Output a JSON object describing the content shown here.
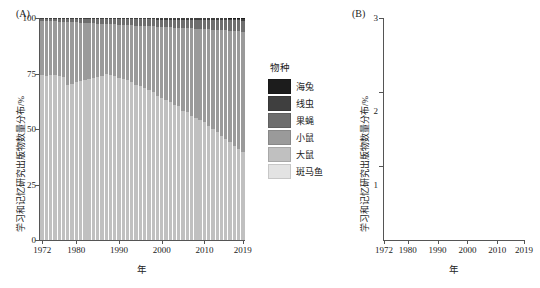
{
  "figure": {
    "panel_a_label": "(A)",
    "panel_b_label": "(B)"
  },
  "legend": {
    "title": "物种",
    "items": [
      {
        "label": "海兔",
        "color": "#1c1c1c"
      },
      {
        "label": "线虫",
        "color": "#3f3f3f"
      },
      {
        "label": "果蝇",
        "color": "#6e6e6e"
      },
      {
        "label": "小鼠",
        "color": "#9a9a9a"
      },
      {
        "label": "大鼠",
        "color": "#c0c0c0"
      },
      {
        "label": "斑马鱼",
        "color": "#e3e3e3"
      }
    ]
  },
  "panel_a": {
    "axis_title_y": "学习和记忆研究出版物数量分布/%",
    "axis_title_x": "年",
    "y_ticks": [
      "0",
      "25",
      "50",
      "75",
      "100"
    ],
    "x_ticks": [
      "1972",
      "1980",
      "1990",
      "2000",
      "2010",
      "2019"
    ]
  },
  "panel_b": {
    "axis_title_y": "学习和记忆研究出版物数量分布/%",
    "axis_title_x": "年",
    "y_ticks": [
      "1",
      "2",
      "3"
    ],
    "x_ticks": [
      "1972",
      "1980",
      "1990",
      "2000",
      "2010",
      "2019"
    ]
  },
  "chart_data": [
    {
      "type": "bar",
      "id": "panel-A",
      "title": "",
      "subtitle": "Stacked 100% composition of model species in learning & memory publications",
      "stacked": true,
      "stack_mode": "percent",
      "xlabel": "年",
      "ylabel": "学习和记忆研究出版物数量分布/%",
      "ylim": [
        0,
        100
      ],
      "grid": false,
      "legend_position": "right",
      "categories": [
        1972,
        1973,
        1974,
        1975,
        1976,
        1977,
        1978,
        1979,
        1980,
        1981,
        1982,
        1983,
        1984,
        1985,
        1986,
        1987,
        1988,
        1989,
        1990,
        1991,
        1992,
        1993,
        1994,
        1995,
        1996,
        1997,
        1998,
        1999,
        2000,
        2001,
        2002,
        2003,
        2004,
        2005,
        2006,
        2007,
        2008,
        2009,
        2010,
        2011,
        2012,
        2013,
        2014,
        2015,
        2016,
        2017,
        2018,
        2019
      ],
      "series": [
        {
          "name": "大鼠",
          "color": "#c0c0c0",
          "values": [
            74.5,
            74.0,
            74.2,
            74.5,
            74.0,
            73.5,
            70.0,
            70.5,
            71.0,
            71.5,
            72.0,
            72.5,
            73.0,
            73.5,
            74.0,
            75.0,
            74.5,
            74.0,
            73.0,
            72.5,
            72.0,
            71.0,
            70.0,
            69.5,
            68.5,
            67.5,
            66.5,
            65.0,
            64.0,
            63.0,
            62.0,
            61.0,
            60.5,
            58.0,
            57.5,
            56.0,
            55.0,
            54.0,
            53.0,
            51.5,
            50.0,
            48.5,
            47.0,
            45.5,
            44.0,
            42.5,
            41.0,
            39.5
          ]
        },
        {
          "name": "小鼠",
          "color": "#9a9a9a",
          "values": [
            24.0,
            24.5,
            24.3,
            24.0,
            24.4,
            24.8,
            28.2,
            27.6,
            27.0,
            26.4,
            25.8,
            25.2,
            24.6,
            24.0,
            23.4,
            22.3,
            22.7,
            23.1,
            24.0,
            24.4,
            24.8,
            25.7,
            26.6,
            27.0,
            27.9,
            28.8,
            29.7,
            31.1,
            32.0,
            32.9,
            33.8,
            34.7,
            35.1,
            37.5,
            37.9,
            39.3,
            40.2,
            41.1,
            42.0,
            43.4,
            44.8,
            46.2,
            47.6,
            49.0,
            50.3,
            51.7,
            53.1,
            54.4
          ]
        },
        {
          "name": "果蝇",
          "color": "#6e6e6e",
          "values": [
            1.1,
            1.1,
            1.2,
            1.1,
            1.2,
            1.3,
            1.4,
            1.5,
            1.6,
            1.7,
            1.8,
            1.9,
            2.0,
            2.1,
            2.2,
            2.3,
            2.4,
            2.4,
            2.5,
            2.6,
            2.7,
            2.8,
            2.9,
            2.9,
            3.0,
            3.1,
            3.2,
            3.2,
            3.3,
            3.4,
            3.5,
            3.6,
            3.6,
            3.7,
            3.8,
            3.9,
            3.9,
            4.0,
            4.1,
            4.2,
            4.3,
            4.4,
            4.4,
            4.5,
            4.6,
            4.7,
            4.8,
            4.9
          ]
        },
        {
          "name": "线虫",
          "color": "#3f3f3f",
          "values": [
            0.2,
            0.2,
            0.2,
            0.2,
            0.2,
            0.2,
            0.2,
            0.2,
            0.2,
            0.2,
            0.2,
            0.2,
            0.2,
            0.2,
            0.2,
            0.2,
            0.2,
            0.3,
            0.3,
            0.3,
            0.3,
            0.3,
            0.3,
            0.4,
            0.4,
            0.4,
            0.4,
            0.5,
            0.5,
            0.5,
            0.5,
            0.5,
            0.6,
            0.6,
            0.6,
            0.6,
            0.7,
            0.7,
            0.7,
            0.7,
            0.7,
            0.7,
            0.8,
            0.8,
            0.8,
            0.8,
            0.8,
            0.9
          ]
        },
        {
          "name": "海兔",
          "color": "#1c1c1c",
          "values": [
            0.2,
            0.2,
            0.1,
            0.2,
            0.2,
            0.2,
            0.2,
            0.2,
            0.2,
            0.2,
            0.2,
            0.2,
            0.2,
            0.2,
            0.2,
            0.2,
            0.2,
            0.2,
            0.2,
            0.2,
            0.2,
            0.2,
            0.2,
            0.2,
            0.2,
            0.2,
            0.2,
            0.2,
            0.2,
            0.2,
            0.2,
            0.2,
            0.2,
            0.2,
            0.2,
            0.2,
            0.2,
            0.2,
            0.2,
            0.2,
            0.2,
            0.2,
            0.2,
            0.2,
            0.3,
            0.3,
            0.3,
            0.3
          ]
        },
        {
          "name": "斑马鱼",
          "color": "#e3e3e3",
          "values": [
            0.0,
            0.0,
            0.0,
            0.0,
            0.0,
            0.0,
            0.0,
            0.0,
            0.0,
            0.0,
            0.0,
            0.0,
            0.0,
            0.0,
            0.0,
            0.0,
            0.0,
            0.0,
            0.0,
            0.0,
            0.0,
            0.0,
            0.0,
            0.0,
            0.0,
            0.0,
            0.0,
            0.0,
            0.0,
            0.0,
            0.0,
            0.0,
            0.0,
            0.0,
            0.0,
            0.0,
            0.0,
            0.0,
            0.0,
            0.0,
            0.0,
            0.0,
            0.0,
            0.0,
            0.0,
            0.0,
            0.0,
            0.0
          ]
        }
      ]
    },
    {
      "type": "line",
      "id": "panel-B",
      "title": "",
      "subtitle": "Non-rodent model species share of learning & memory publications",
      "xlabel": "年",
      "ylabel": "学习和记忆研究出版物数量分布/%",
      "xlim": [
        1972,
        2019
      ],
      "ylim": [
        0,
        3
      ],
      "grid": false,
      "legend_position": "none",
      "x": [
        1972,
        1973,
        1974,
        1975,
        1976,
        1977,
        1978,
        1979,
        1980,
        1981,
        1982,
        1983,
        1984,
        1985,
        1986,
        1987,
        1988,
        1989,
        1990,
        1991,
        1992,
        1993,
        1994,
        1995,
        1996,
        1997,
        1998,
        1999,
        2000,
        2001,
        2002,
        2003,
        2004,
        2005,
        2006,
        2007,
        2008,
        2009,
        2010,
        2011,
        2012,
        2013,
        2014,
        2015,
        2016,
        2017,
        2018,
        2019
      ],
      "series": [
        {
          "name": "海兔",
          "color": "#1a1a1a",
          "linewidth": 1.0,
          "values": [
            0.05,
            0.22,
            0.12,
            0.3,
            0.16,
            0.34,
            0.2,
            0.42,
            1.02,
            0.78,
            1.22,
            0.9,
            1.28,
            1.0,
            1.3,
            1.58,
            1.78,
            2.15,
            1.7,
            1.55,
            1.4,
            1.22,
            1.1,
            1.12,
            1.06,
            1.04,
            1.1,
            1.16,
            1.12,
            0.62,
            0.78,
            0.7,
            0.86,
            0.62,
            0.84,
            0.58,
            0.72,
            0.52,
            0.74,
            0.66,
            0.62,
            0.6,
            0.58,
            0.56,
            0.5,
            0.46,
            0.42,
            0.4
          ]
        },
        {
          "name": "果蝇",
          "color": "#7a7a7a",
          "linewidth": 1.0,
          "values": [
            0.08,
            0.26,
            0.18,
            0.34,
            0.24,
            0.4,
            0.3,
            0.46,
            0.52,
            0.44,
            0.56,
            0.5,
            0.66,
            0.78,
            0.92,
            1.08,
            1.14,
            1.16,
            0.76,
            1.18,
            1.3,
            1.26,
            1.52,
            1.42,
            1.62,
            1.8,
            1.72,
            2.02,
            2.24,
            1.92,
            2.12,
            2.28,
            2.04,
            2.42,
            2.2,
            2.32,
            2.46,
            2.38,
            2.58,
            2.52,
            2.7,
            2.62,
            2.78,
            2.72,
            2.86,
            2.76,
            2.92,
            2.72
          ]
        },
        {
          "name": "线虫",
          "color": "#4a4a4a",
          "linewidth": 1.0,
          "values": [
            0.02,
            0.02,
            0.02,
            0.02,
            0.02,
            0.02,
            0.02,
            0.02,
            0.02,
            0.02,
            0.02,
            0.02,
            0.02,
            0.02,
            0.03,
            0.04,
            0.04,
            0.05,
            0.06,
            0.18,
            0.08,
            0.22,
            0.14,
            0.28,
            0.24,
            0.34,
            0.3,
            0.38,
            0.42,
            0.48,
            0.44,
            0.52,
            0.5,
            0.58,
            0.54,
            0.62,
            0.56,
            0.66,
            0.6,
            0.7,
            0.74,
            0.8,
            0.78,
            0.86,
            0.9,
            0.94,
            1.0,
            1.15
          ]
        }
      ]
    }
  ]
}
